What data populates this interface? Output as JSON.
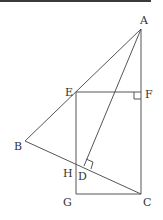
{
  "figure": {
    "points": {
      "A": {
        "label": "A",
        "x": 141,
        "y": 29
      },
      "B": {
        "label": "B",
        "x": 25,
        "y": 141
      },
      "C": {
        "label": "C",
        "x": 141,
        "y": 194
      },
      "D": {
        "label": "D",
        "x": 84,
        "y": 166
      },
      "E": {
        "label": "E",
        "x": 76,
        "y": 92
      },
      "F": {
        "label": "F",
        "x": 141,
        "y": 92
      },
      "G": {
        "label": "G",
        "x": 76,
        "y": 194
      },
      "H": {
        "label": "H",
        "x": 76,
        "y": 164
      }
    },
    "segments": [
      "AB",
      "AC",
      "AD",
      "BC",
      "EF",
      "EG",
      "GC"
    ],
    "right_angles": [
      "at F (EF ⟂ AC)",
      "at D (AD ⟂ BC)"
    ]
  }
}
